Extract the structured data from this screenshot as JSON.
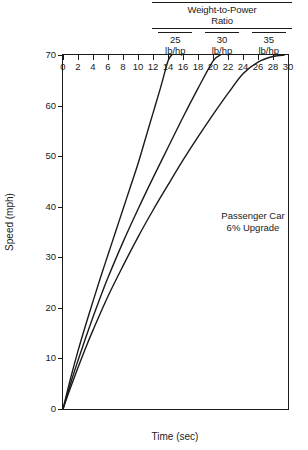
{
  "legend": {
    "title": "Weight-to-Power Ratio",
    "title_line1": "Weight-to-Power",
    "title_line2": "Ratio",
    "columns": [
      {
        "ratio": "25",
        "unit": "lb/hp"
      },
      {
        "ratio": "30",
        "unit": "lb/hp"
      },
      {
        "ratio": "35",
        "unit": "lb/hp"
      }
    ]
  },
  "annotation": {
    "line1": "Passenger Car",
    "line2": "6% Upgrade"
  },
  "axes": {
    "xlabel": "Time (sec)",
    "ylabel": "Speed (mph)",
    "xticks": [
      "0",
      "2",
      "4",
      "6",
      "8",
      "10",
      "12",
      "14",
      "16",
      "18",
      "20",
      "22",
      "24",
      "26",
      "28",
      "30"
    ],
    "yticks": [
      "0",
      "10",
      "20",
      "30",
      "40",
      "50",
      "60",
      "70"
    ]
  },
  "chart_data": {
    "type": "line",
    "title": "",
    "xlabel": "Time (sec)",
    "ylabel": "Speed (mph)",
    "xlim": [
      0,
      30
    ],
    "ylim": [
      0,
      70
    ],
    "xticks": [
      0,
      2,
      4,
      6,
      8,
      10,
      12,
      14,
      16,
      18,
      20,
      22,
      24,
      26,
      28,
      30
    ],
    "yticks": [
      0,
      10,
      20,
      30,
      40,
      50,
      60,
      70
    ],
    "grid": false,
    "legend_position": "top-right-table",
    "annotations": [
      "Passenger Car",
      "6% Upgrade"
    ],
    "series": [
      {
        "name": "25 lb/hp",
        "x": [
          0,
          1,
          2,
          3,
          4,
          5,
          6,
          7,
          8,
          9,
          10,
          11,
          12,
          13,
          14,
          14.5
        ],
        "y": [
          0,
          6.0,
          11.5,
          16.5,
          21.3,
          26.0,
          30.5,
          35.0,
          39.5,
          44.0,
          48.5,
          53.5,
          58.5,
          63.5,
          68.8,
          70.0
        ]
      },
      {
        "name": "30 lb/hp",
        "x": [
          0,
          1,
          2,
          3,
          4,
          5,
          6,
          8,
          10,
          12,
          14,
          16,
          18,
          20,
          21
        ],
        "y": [
          0,
          5.0,
          9.6,
          14.0,
          18.2,
          22.2,
          26.0,
          33.0,
          39.5,
          45.7,
          51.7,
          57.7,
          63.4,
          68.8,
          70.0
        ]
      },
      {
        "name": "35 lb/hp",
        "x": [
          0,
          1,
          2,
          3,
          4,
          6,
          8,
          10,
          12,
          14,
          16,
          18,
          20,
          22,
          24,
          26,
          28,
          29.5
        ],
        "y": [
          0,
          4.2,
          8.2,
          12.0,
          15.6,
          22.3,
          28.3,
          34.0,
          39.3,
          44.3,
          49.2,
          53.8,
          58.2,
          62.4,
          66.3,
          68.6,
          69.7,
          70.0
        ]
      }
    ]
  }
}
